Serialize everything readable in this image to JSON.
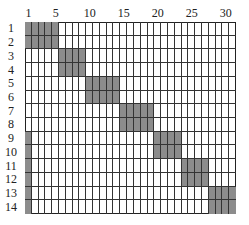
{
  "grid": {
    "rows": 14,
    "cols": 31,
    "shade_color": "#8c8c8c",
    "line_color": "#333333",
    "col_labels": [
      {
        "col": 1,
        "text": "1"
      },
      {
        "col": 5,
        "text": "5"
      },
      {
        "col": 10,
        "text": "10"
      },
      {
        "col": 15,
        "text": "15"
      },
      {
        "col": 20,
        "text": "20"
      },
      {
        "col": 25,
        "text": "25"
      },
      {
        "col": 30,
        "text": "30"
      }
    ],
    "row_labels": [
      "1",
      "2",
      "3",
      "4",
      "5",
      "6",
      "7",
      "8",
      "9",
      "10",
      "11",
      "12",
      "13",
      "14"
    ],
    "shaded_blocks": [
      {
        "rows": [
          1,
          2
        ],
        "cols": [
          1,
          5
        ]
      },
      {
        "rows": [
          3,
          4
        ],
        "cols": [
          6,
          9
        ]
      },
      {
        "rows": [
          5,
          6
        ],
        "cols": [
          10,
          14
        ]
      },
      {
        "rows": [
          7,
          8
        ],
        "cols": [
          15,
          19
        ]
      },
      {
        "rows": [
          9,
          10
        ],
        "cols": [
          20,
          23
        ]
      },
      {
        "rows": [
          11,
          12
        ],
        "cols": [
          24,
          27
        ]
      },
      {
        "rows": [
          13,
          14
        ],
        "cols": [
          28,
          31
        ]
      },
      {
        "rows": [
          9,
          14
        ],
        "cols": [
          1,
          1
        ]
      }
    ]
  }
}
